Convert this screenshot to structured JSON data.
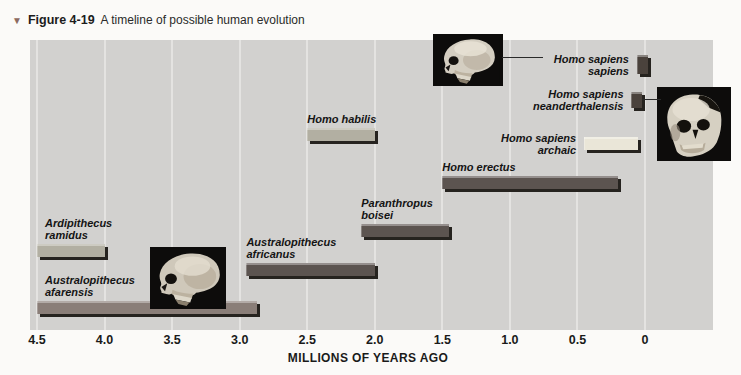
{
  "caption": {
    "marker": "▼",
    "figure_label": "Figure 4-19",
    "figure_title": "A timeline of possible human evolution"
  },
  "chart_data": {
    "type": "bar",
    "orientation": "horizontal-timeline",
    "title": "A timeline of possible human evolution",
    "xlabel": "MILLIONS OF YEARS AGO",
    "axis_range": [
      4.5,
      0
    ],
    "grid": "vertical lines at each 0.5 interval",
    "x_tick_labels": [
      "4.5",
      "4.0",
      "3.5",
      "3.0",
      "2.5",
      "2.0",
      "1.5",
      "1.0",
      "0.5",
      "0"
    ],
    "x_tick_values": [
      4.5,
      4.0,
      3.5,
      3.0,
      2.5,
      2.0,
      1.5,
      1.0,
      0.5,
      0
    ],
    "series": [
      {
        "name": "Ardipithecus ramidus",
        "name_lines": [
          "Ardipithecus",
          "ramidus"
        ],
        "start_mya": 4.5,
        "end_mya": 4.0,
        "bar_style": "light",
        "row_y": 204,
        "label_side": "above",
        "label_dx": 8
      },
      {
        "name": "Australopithecus afarensis",
        "name_lines": [
          "Australopithecus",
          "afarensis"
        ],
        "start_mya": 4.5,
        "end_mya": 2.87,
        "bar_style": "medium",
        "row_y": 261,
        "label_side": "above",
        "label_dx": 8
      },
      {
        "name": "Australopithecus africanus",
        "name_lines": [
          "Australopithecus",
          "africanus"
        ],
        "start_mya": 2.95,
        "end_mya": 2.0,
        "bar_style": "dark",
        "row_y": 223,
        "label_side": "above",
        "label_dx": 0
      },
      {
        "name": "Paranthropus boisei",
        "name_lines": [
          "Paranthropus",
          "boisei"
        ],
        "start_mya": 2.1,
        "end_mya": 1.45,
        "bar_style": "dark",
        "row_y": 184,
        "label_side": "above",
        "label_dx": 0
      },
      {
        "name": "Homo habilis",
        "name_lines": [
          "Homo habilis"
        ],
        "start_mya": 2.5,
        "end_mya": 2.0,
        "bar_style": "light",
        "row_y": 88,
        "label_side": "above",
        "label_dx": 0
      },
      {
        "name": "Homo erectus",
        "name_lines": [
          "Homo erectus"
        ],
        "start_mya": 1.5,
        "end_mya": 0.2,
        "bar_style": "dark",
        "row_y": 136,
        "label_side": "above",
        "label_dx": 0
      },
      {
        "name": "Homo sapiens archaic",
        "name_lines": [
          "Homo sapiens",
          "archaic"
        ],
        "start_mya": 0.45,
        "end_mya": 0.05,
        "bar_style": "cream",
        "row_y": 97,
        "label_side": "left"
      },
      {
        "name": "Homo sapiens neanderthalensis",
        "name_lines": [
          "Homo sapiens",
          "neanderthalensis"
        ],
        "start_mya": 0.1,
        "end_mya": 0.02,
        "bar_style": "block",
        "row_y": 52,
        "bar_height": 16,
        "label_side": "left"
      },
      {
        "name": "Homo sapiens sapiens",
        "name_lines": [
          "Homo sapiens",
          "sapiens"
        ],
        "start_mya": 0.06,
        "end_mya": -0.02,
        "bar_style": "block",
        "row_y": 15,
        "bar_height": 19,
        "label_side": "left"
      }
    ]
  },
  "colors": {
    "page_bg": "#fbfaf8",
    "panel_bg": "#d2d1cf",
    "gridline": "#e4e3e1",
    "bar_light": "#b2afa2",
    "bar_medium": "#8a7e78",
    "bar_dark": "#5c5450",
    "bar_cream": "#eae6d8",
    "bar_block": "#4a423c",
    "bar_shadow": "#26231f",
    "caption_marker": "#8d6a60"
  },
  "skulls": [
    {
      "id": "afarensis-skull-photo",
      "view": "side"
    },
    {
      "id": "sapiens-skull-photo",
      "view": "side"
    },
    {
      "id": "neanderthal-skull-photo",
      "view": "three-quarter"
    }
  ]
}
